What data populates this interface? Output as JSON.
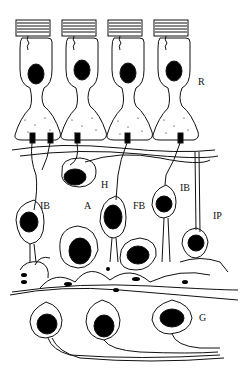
{
  "figure": {
    "labels": [
      {
        "id": "R",
        "text": "R",
        "x": 198,
        "y": 77
      },
      {
        "id": "H",
        "text": "H",
        "x": 101,
        "y": 180
      },
      {
        "id": "IB_left",
        "text": "IB",
        "x": 40,
        "y": 201
      },
      {
        "id": "A",
        "text": "A",
        "x": 84,
        "y": 201
      },
      {
        "id": "FB",
        "text": "FB",
        "x": 133,
        "y": 201
      },
      {
        "id": "IB_right",
        "text": "IB",
        "x": 180,
        "y": 183
      },
      {
        "id": "IP",
        "text": "IP",
        "x": 213,
        "y": 211
      },
      {
        "id": "G",
        "text": "G",
        "x": 199,
        "y": 313
      }
    ],
    "colors": {
      "line": "#111111",
      "fill": "#000000",
      "background": "#ffffff"
    }
  }
}
